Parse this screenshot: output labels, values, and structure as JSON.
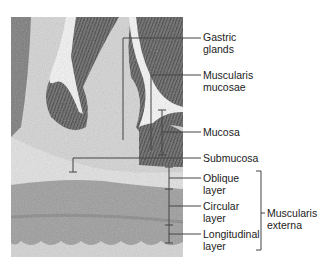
{
  "figure": {
    "image_description": "Light micrograph of stomach wall cross-section",
    "labels": {
      "gastric_glands": [
        "Gastric",
        "glands"
      ],
      "muscularis_mucosae": [
        "Muscularis",
        "mucosae"
      ],
      "mucosa": [
        "Mucosa"
      ],
      "submucosa": [
        "Submucosa"
      ],
      "oblique_layer": [
        "Oblique",
        "layer"
      ],
      "circular_layer": [
        "Circular",
        "layer"
      ],
      "longitudinal_layer": [
        "Longitudinal",
        "layer"
      ],
      "muscularis_externa": [
        "Muscularis",
        "externa"
      ]
    },
    "colors": {
      "line": "#444444",
      "mucosa_dark": "#5a5a5a",
      "submucosa_light": "#d9d9d9",
      "muscle": "#9a9a9a"
    }
  }
}
